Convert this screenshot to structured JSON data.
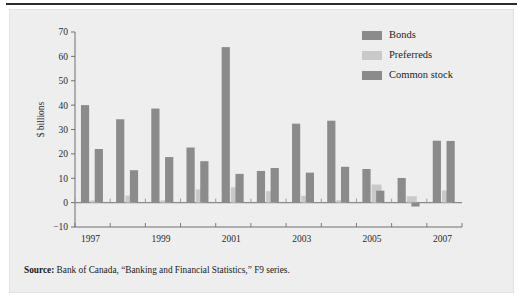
{
  "figure": {
    "panel_bg": "#eeeeee",
    "rule_color": "#2b2b2b",
    "source_bold": "Source:",
    "source_text": " Bank of Canada, “Banking and Financial Statistics,” F9 series."
  },
  "legend": {
    "items": [
      {
        "label": "Bonds",
        "color": "#8b8b8b"
      },
      {
        "label": "Preferreds",
        "color": "#c9c9c9"
      },
      {
        "label": "Common stock",
        "color": "#8b8b8b"
      }
    ]
  },
  "chart_data": {
    "type": "bar",
    "title": "",
    "subtitle": "",
    "xlabel": "",
    "ylabel": "$ billions",
    "ylim": [
      -10,
      70
    ],
    "yticks": [
      -10,
      0,
      10,
      20,
      30,
      40,
      50,
      60,
      70
    ],
    "ytick_labels": [
      "−10",
      "0",
      "10",
      "20",
      "30",
      "40",
      "50",
      "60",
      "70"
    ],
    "grid": false,
    "legend_position": "top-right",
    "categories": [
      1997,
      1998,
      1999,
      2000,
      2001,
      2002,
      2003,
      2004,
      2005,
      2006,
      2007
    ],
    "xtick_labels": [
      "1997",
      "1999",
      "2001",
      "2003",
      "2005",
      "2007"
    ],
    "xticks_shown": [
      1997,
      1999,
      2001,
      2003,
      2005,
      2007
    ],
    "series": [
      {
        "name": "Bonds",
        "color": "#8b8b8b",
        "values": [
          40.0,
          34.2,
          38.6,
          22.6,
          63.8,
          13.0,
          32.4,
          33.6,
          13.8,
          10.1,
          25.4
        ]
      },
      {
        "name": "Preferreds",
        "color": "#c9c9c9",
        "values": [
          0.9,
          2.9,
          0.9,
          5.4,
          6.3,
          4.7,
          2.8,
          1.0,
          7.4,
          2.6,
          5.0
        ]
      },
      {
        "name": "Common stock",
        "color": "#8b8b8b",
        "values": [
          22.0,
          13.3,
          18.7,
          17.0,
          11.8,
          14.2,
          12.3,
          14.7,
          4.9,
          -1.6,
          25.3
        ]
      }
    ]
  }
}
